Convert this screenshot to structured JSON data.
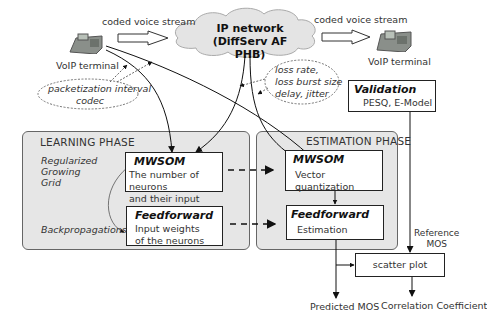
{
  "network": {
    "title_line1": "IP network",
    "title_line2": "(DiffServ AF PHB)"
  },
  "streams": {
    "left_label": "coded voice stream",
    "right_label": "coded voice stream"
  },
  "terminals": {
    "left_label": "VoIP terminal",
    "right_label": "VoIP terminal"
  },
  "params_left": {
    "line1": "packetization interval",
    "line2": "codec"
  },
  "params_right": {
    "line1": "loss rate,",
    "line2": "loss burst size",
    "line3": "delay, jitter"
  },
  "validation": {
    "title": "Validation",
    "body": "PESQ, E-Model"
  },
  "learning": {
    "title": "LEARNING PHASE",
    "side_label_1": "Regularized",
    "side_label_2": "Growing",
    "side_label_3": "Grid",
    "side_label_4": "Backpropagations",
    "mwsom": {
      "title": "MWSOM",
      "line1": "The number of neurons",
      "line2": "and their input weights"
    },
    "feedforward": {
      "title": "Feedforward",
      "line1": "Input weights",
      "line2": "of the neurons"
    }
  },
  "estimation": {
    "title": "ESTIMATION PHASE",
    "mwsom": {
      "title": "MWSOM",
      "body": "Vector quantization"
    },
    "feedforward": {
      "title": "Feedforward",
      "body": "Estimation"
    }
  },
  "reference_mos": {
    "line1": "Reference",
    "line2": "MOS"
  },
  "scatter": {
    "label": "scatter plot"
  },
  "outputs": {
    "predicted": "Predicted MOS",
    "correlation": "Correlation Coefficient"
  }
}
